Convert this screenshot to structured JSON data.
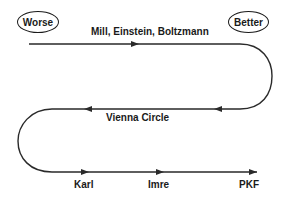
{
  "diagram": {
    "endpoints": {
      "worse": "Worse",
      "better": "Better"
    },
    "path_labels": {
      "top": "Mill, Einstein, Boltzmann",
      "middle": "Vienna Circle"
    },
    "bottom_labels": [
      "Karl",
      "Imre",
      "PKF"
    ],
    "colors": {
      "line": "#2a2a2a",
      "text": "#1a1a1a",
      "background": "#ffffff"
    }
  }
}
